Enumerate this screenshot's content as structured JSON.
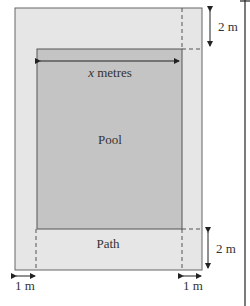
{
  "diagram": {
    "pool_label": "Pool",
    "path_label": "Path",
    "width_label_var": "x",
    "width_label_unit": " metres",
    "top_dim": "2 m",
    "bottom_dim": "2 m",
    "left_dim": "1 m",
    "right_dim": "1 m",
    "colors": {
      "path": "#e6e6e6",
      "pool": "#c4c4c4",
      "line": "#555555"
    }
  }
}
